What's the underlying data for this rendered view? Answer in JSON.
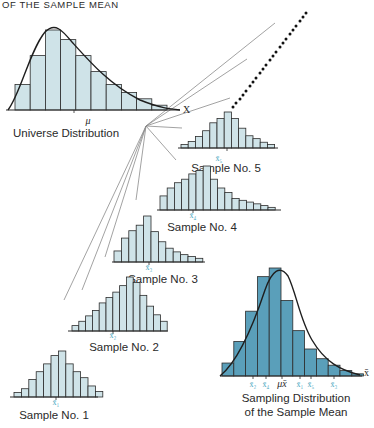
{
  "header": {
    "title": "OF THE SAMPLE MEAN"
  },
  "colors": {
    "light_fill": "#cfe3e8",
    "dark_fill": "#5a9fba",
    "stroke": "#2c2c2c",
    "subscript_accent": "#4aa8c0",
    "connector": "#8a8a8a"
  },
  "universe": {
    "label": "Universe Distribution",
    "axis_label": "X",
    "mean_symbol": "μ",
    "bars": [
      0.32,
      0.68,
      1.0,
      0.88,
      0.68,
      0.48,
      0.32,
      0.22,
      0.14,
      0.06
    ]
  },
  "samples": [
    {
      "label": "Sample No. 1",
      "mean_label": "x̄₁",
      "bars": [
        0.1,
        0.18,
        0.38,
        0.55,
        0.72,
        0.9,
        1.0,
        0.72,
        0.55,
        0.42,
        0.24,
        0.12
      ]
    },
    {
      "label": "Sample No. 2",
      "mean_label": "x̄₂",
      "bars": [
        0.1,
        0.18,
        0.28,
        0.38,
        0.52,
        0.62,
        0.72,
        0.84,
        1.0,
        0.9,
        0.66,
        0.46,
        0.3,
        0.18
      ]
    },
    {
      "label": "Sample No. 3",
      "mean_label": "x̄₃",
      "bars": [
        0.24,
        0.52,
        0.68,
        0.8,
        1.0,
        0.66,
        0.44,
        0.3,
        0.22,
        0.16,
        0.12,
        0.08
      ]
    },
    {
      "label": "Sample No. 4",
      "mean_label": "x̄₄",
      "bars": [
        0.32,
        0.5,
        0.62,
        0.7,
        0.82,
        0.9,
        1.0,
        0.7,
        0.5,
        0.4,
        0.26,
        0.22,
        0.18,
        0.14,
        0.1,
        0.06
      ]
    },
    {
      "label": "Sample No. 5",
      "mean_label": "x̄₅",
      "bars": [
        0.1,
        0.18,
        0.32,
        0.48,
        0.7,
        0.82,
        1.0,
        0.82,
        0.55,
        0.34,
        0.26,
        0.16,
        0.1
      ]
    }
  ],
  "sampling_distribution": {
    "label_line1": "Sampling Distribution",
    "label_line2": "of the Sample Mean",
    "axis_label": "x̄",
    "mean_symbol": "μx̄",
    "tick_labels": [
      "x̄₂",
      "x̄₄",
      "μx̄",
      "x̄₁",
      "x̄₅",
      "x̄₃"
    ],
    "bars": [
      0.12,
      0.32,
      0.6,
      0.92,
      1.0,
      0.7,
      0.42,
      0.25,
      0.16,
      0.1,
      0.05,
      0.02
    ]
  }
}
